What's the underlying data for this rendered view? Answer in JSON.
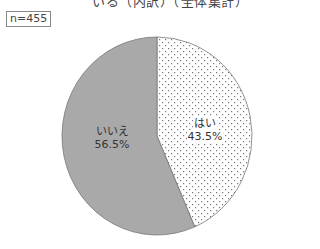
{
  "chart_data": {
    "type": "pie",
    "title": "いる（内訳）（全体集計）",
    "sample_size_label": "n=455",
    "categories": [
      "はい",
      "いいえ"
    ],
    "values": [
      43.5,
      56.5
    ],
    "unit": "%",
    "slices": [
      {
        "label": "はい",
        "value": 43.5,
        "value_label": "43.5%",
        "fill": "dotted-white",
        "color": "#ffffff"
      },
      {
        "label": "いいえ",
        "value": 56.5,
        "value_label": "56.5%",
        "fill": "solid-gray",
        "color": "#a9a9a9"
      }
    ],
    "start_angle": "12 o'clock",
    "direction": "clockwise"
  },
  "header": {
    "title": "いる（内訳）（全体集計）",
    "n_label": "n=455"
  },
  "labels": {
    "yes_name": "はい",
    "yes_pct": "43.5%",
    "no_name": "いいえ",
    "no_pct": "56.5%"
  }
}
